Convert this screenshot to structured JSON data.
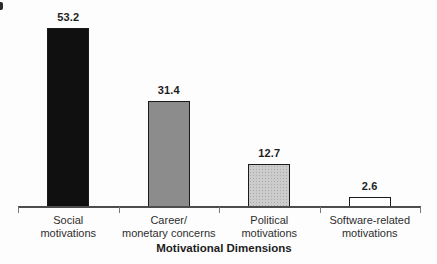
{
  "chart_data": {
    "type": "bar",
    "title": "",
    "xlabel": "Motivational Dimensions",
    "ylabel": "",
    "categories": [
      "Social\nmotivations",
      "Career/\nmonetary concerns",
      "Political\nmotivations",
      "Software-related\nmotivations"
    ],
    "values": [
      53.2,
      31.4,
      12.7,
      2.6
    ],
    "bars": [
      {
        "label": "Social\nmotivations",
        "value": 53.2,
        "value_label": "53.2",
        "fill": "#101010",
        "texture": "solid"
      },
      {
        "label": "Career/\nmonetary concerns",
        "value": 31.4,
        "value_label": "31.4",
        "fill": "#8c8c8c",
        "texture": "solid"
      },
      {
        "label": "Political\nmotivations",
        "value": 12.7,
        "value_label": "12.7",
        "fill": "#cccccc",
        "texture": "stipple"
      },
      {
        "label": "Software-related\nmotivations",
        "value": 2.6,
        "value_label": "2.6",
        "fill": "#fefefe",
        "texture": "solid"
      }
    ],
    "ylim": [
      0,
      60
    ],
    "grid": false,
    "legend": "none",
    "bar_outline_color": "#1a1a1a",
    "axis_color": "#4d4d4d"
  }
}
